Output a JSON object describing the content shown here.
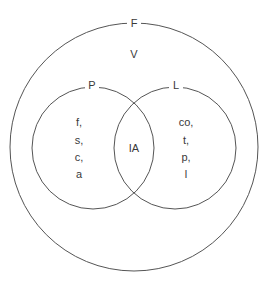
{
  "diagram": {
    "type": "venn",
    "outer_set": {
      "label": "F",
      "inner_label": "V"
    },
    "left_set": {
      "label": "P",
      "items": [
        "f,",
        "s,",
        "c,",
        "a"
      ]
    },
    "right_set": {
      "label": "L",
      "items": [
        "co,",
        "t,",
        "p,",
        "l"
      ]
    },
    "intersection": {
      "label": "IA"
    },
    "colors": {
      "stroke": "#555555",
      "text": "#3a3a3a",
      "background": "#ffffff"
    }
  }
}
